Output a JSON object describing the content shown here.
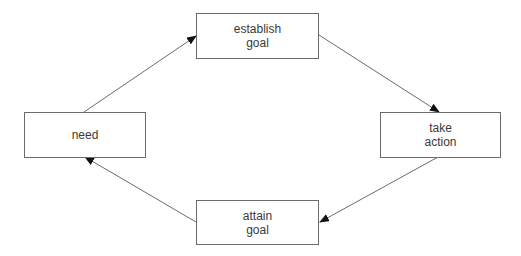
{
  "diagram": {
    "type": "cycle",
    "nodes": [
      {
        "id": "need",
        "lines": [
          "need"
        ]
      },
      {
        "id": "establish_goal",
        "lines": [
          "establish",
          "goal"
        ]
      },
      {
        "id": "take_action",
        "lines": [
          "take",
          "action"
        ]
      },
      {
        "id": "attain_goal",
        "lines": [
          "attain",
          "goal"
        ]
      }
    ],
    "edges": [
      {
        "from": "need",
        "to": "establish_goal"
      },
      {
        "from": "establish_goal",
        "to": "take_action"
      },
      {
        "from": "take_action",
        "to": "attain_goal"
      },
      {
        "from": "attain_goal",
        "to": "need"
      }
    ],
    "colors": {
      "line": "#6b6b6b",
      "arrow": "#111111",
      "text": "#3a3a3a"
    }
  }
}
